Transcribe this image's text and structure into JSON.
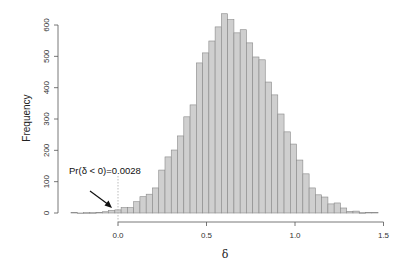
{
  "chart_data": {
    "type": "bar",
    "subtype": "histogram",
    "title": "",
    "xlabel": "δ",
    "ylabel": "Frequency",
    "xlim": [
      -0.27,
      1.5
    ],
    "ylim": [
      0,
      640
    ],
    "xticks": [
      0.0,
      0.5,
      1.0,
      1.5
    ],
    "xtick_labels": [
      "0.0",
      "0.5",
      "1.0",
      "1.5"
    ],
    "yticks": [
      0,
      100,
      200,
      300,
      400,
      500,
      600
    ],
    "ytick_labels": [
      "0",
      "100",
      "200",
      "300",
      "400",
      "500",
      "600"
    ],
    "grid": false,
    "legend": null,
    "bin_start": -0.2655,
    "bin_width": 0.0354,
    "counts": [
      2,
      0,
      1,
      1,
      2,
      4,
      8,
      10,
      17,
      17,
      36,
      52,
      60,
      80,
      137,
      179,
      201,
      246,
      307,
      345,
      479,
      511,
      549,
      594,
      636,
      617,
      575,
      585,
      543,
      498,
      489,
      418,
      377,
      316,
      259,
      220,
      169,
      125,
      80,
      58,
      51,
      29,
      32,
      16,
      5,
      6,
      1,
      2,
      2
    ],
    "annotations": [
      {
        "text": "Pr(δ < 0)=0.0028",
        "type": "arrow-label",
        "points_to_x": -0.04,
        "points_to_y": 10
      },
      {
        "type": "dotted-vline",
        "x": 0.0
      }
    ],
    "colors": {
      "bar_fill": "#cfcfcf",
      "bar_edge": "#888888",
      "axis": "#555555"
    }
  }
}
